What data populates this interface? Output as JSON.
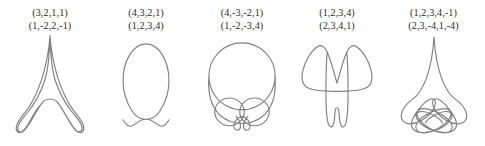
{
  "panel": {
    "background_color": "#ffffff",
    "stroke_color": "#808080",
    "text_color": "#2b2b2b",
    "figure_count": 5
  },
  "figures": [
    {
      "index": 1,
      "label_top": "(3,2,1,1)",
      "label_bottom": "(1,-2,2,-1)",
      "shape_name": "spire-with-two-base-loops",
      "left": 2,
      "width": 96
    },
    {
      "index": 2,
      "label_top": "(4,3,2,1)",
      "label_bottom": "(1,2,3,4)",
      "shape_name": "round-scalloped-bottom-curve",
      "left": 98,
      "width": 96
    },
    {
      "index": 3,
      "label_top": "(4,-3,-2,1)",
      "label_bottom": "(1,-2,-3,4)",
      "shape_name": "skull-two-eyes-and-nose-loop",
      "left": 192,
      "width": 100
    },
    {
      "index": 4,
      "label_top": "(1,2,3,4)",
      "label_bottom": "(2,3,4,1)",
      "shape_name": "butterfly-two-wings-two-legs",
      "left": 288,
      "width": 98
    },
    {
      "index": 5,
      "label_top": "(1,2,3,4,-1)",
      "label_bottom": "(2,3,-4,1,-4)",
      "shape_name": "spire-with-three-petal-loops",
      "left": 384,
      "width": 99
    }
  ],
  "paths": {
    "figure1": "M50,2 C49.2,16 46,36 40,56 C34,74 27,88 21,96 C14.5,104.5 9,110 7.5,116.5 C6,123 9.5,127 14.5,124.5 C20,121.5 25,112 29.5,104 C33.5,97 36,93 38,90 C40,87.5 41,86 41.5,85.5 M50,2 C50.8,16 54,36 60,56 C66,74 73,88 79,96 C85.5,104.5 91,110 92.5,116.5 C94,123 90.5,127 85.5,124.5 C80,121.5 75,112 70.5,104 C66.5,97 64,93 62,90 C60,87.5 59,86 58.5,85.5 M41.5,85.5 C43.5,83.5 46.5,82.5 50,82.5 C53.5,82.5 56.5,83.5 58.5,85.5 C62,89 65.5,95 69.5,102 C74,110 79,119.5 84,123 C88,125.6 91.5,123 90.5,117.5 C89.5,112 84,106.5 78,99 C71,90.5 63,77 57,60 C52.5,47 50.5,22 50,2 M38,90 C34,94 31,99 28,104.5 C24,112 19,121 15,123.5 C11,126 8.5,123 9.5,117.5 C10.5,112 16,106.5 22,99 C29,90.5 37,77 43,60 C47.5,47 49.5,22 50,2",
    "figure2": "M50,104 C42,104 37,100.5 33,94 C27,84.5 22,72 22,57 C22,33 34,12 50,12 C66,12 78,33 78,57 C78,72 73,84.5 67,94 C63,100.5 58,104 50,104 M50,104 C44.5,104 41,106.5 38,109 C35,111.5 33,112.5 31,112.5 C28.5,112.5 26.5,111 25,109 C23.5,107 22.5,105.5 22,104.8 M50,104 C55.5,104 59,106.5 62,109 C65,111.5 67,112.5 69,112.5 C71.5,112.5 73.5,111 75,109 C76.5,107 77.5,105.5 78,104.8",
    "figure3": "M50,10 C70.5,10 87,26.5 87,47 C87,62 78.5,75 66,81 M50,10 C29.5,10 13,26.5 13,47 C13,62 21.5,75 34,81 M34,81 C39,83.5 44.3,84.8 50,84.8 C55.7,84.8 61,83.5 66,81 M13,47 C13,47 11.8,62 15,73 C18.5,85 26,93.5 36.5,97.5 C41,99.2 45.5,100 50,100 C54.5,100 59,99.2 63.5,97.5 C74,93.5 81.5,85 85,73 C88.2,62 87,47 87,47 M36,71.5 C45,71.5 52.5,78.5 52.5,87 C52.5,95.5 45,102.5 36,102.5 C27,102.5 19.5,95.5 19.5,87 C19.5,78.5 27,71.5 36,71.5 M64,71.5 C73,71.5 80.5,78.5 80.5,87 C80.5,95.5 73,102.5 64,102.5 C55,102.5 47.5,95.5 47.5,87 C47.5,78.5 55,71.5 64,71.5 M43.5,92 C46,95 48,98.5 48.3,102 C48.6,105.6 46.5,108 44,107.3 C41.5,106.6 40.5,103.5 41.3,100.3 C42,97.3 44.5,94.8 47,93.3 C48.2,92.6 49.3,92.3 50,92.3 C50.7,92.3 51.8,92.6 53,93.3 C55.5,94.8 58,97.3 58.7,100.3 C59.5,103.5 58.5,106.6 56,107.3 C53.5,108 51.4,105.6 51.7,102 C52,98.5 54,95 56.5,92",
    "figure4": "M50,60 C46,46 42.5,32 38,22 C34.5,14.5 30.5,12.5 26,15.5 C18.5,20.5 11.5,32 8.5,44 C6,54 8,62.5 15,66 C23,70 36,70 50,70 M50,60 C54,46 57.5,32 62,22 C65.5,14.5 69.5,12.5 74,15.5 C81.5,20.5 88.5,32 91.5,44 C94,54 92,62.5 85,66 C77,70 64,70 50,70 M38,22 C37,34 36.5,52 36.5,70 C36.5,86 37,98.5 38.5,106 C39.5,111.5 41.5,114 43.5,113 C45.5,112 46.5,108 47,103 C47.3,99.5 47.5,96 47.8,93 M62,22 C63,34 63.5,52 63.5,70 C63.5,86 63,98.5 61.5,106 C60.5,111.5 58.5,114 56.5,113 C54.5,112 53.5,108 53,103 C52.7,99.5 52.5,96 52.2,93 M47.8,93 C48.2,91 49,90 50,90 C51,90 51.8,91 52.2,93",
    "figure5": "M50,4 C49,20 46,42 40,58 C35,71 29,80 23,84.5 M50,4 C51,20 54,42 60,58 C65,71 71,80 77,84.5 M23,84.5 C16,89.5 10,96 8,102.5 C5.5,110.5 9.5,117 18,117.5 C28,118 40,111 47,101.5 C51,96 52.5,91 51.5,87.5 C50.8,85 48.5,84 45.5,85 C41,86.5 35,92 30,98.5 C24.5,105.5 20,113 20.5,119 C21,125.5 27.5,129.5 37,129 C49,128.3 62,121.5 68.5,113 C72.5,107.8 73,103 70.5,100 C68.2,97.3 63,97 57,98.5 C48,100.8 37.5,106 31.5,112 C26.5,117 25,122 27.5,125.5 C30.5,129.5 38.5,130 47.5,127.5 C58,124.6 68,118 72,111.5 C74.8,107 74,103 69.5,101.8 C65,100.6 57.5,102.5 51,106 C45,109.2 40.5,113 39,116.5 M77,84.5 C84,89.5 90,96 92,102.5 C94.5,110.5 90.5,117 82,117.5 C72,118 60,111 53,101.5 C49,96 47.5,91 48.5,87.5 C49.2,85 51.5,84 54.5,85 C59,86.5 65,92 70,98.5 C75.5,105.5 80,113 79.5,119 C79,125.5 72.5,129.5 63,129 C51,128.3 38,121.5 31.5,113 C27.5,107.8 27,103 29.5,100 C31.8,97.3 37,97 43,98.5 C52,100.8 62.5,106 68.5,112 C73.5,117 75,122 72.5,125.5 C69.5,129.5 61.5,130 52.5,127.5 C42,124.6 32,118 28,111.5 C25.2,107 26,103 30.5,101.8 C35,100.6 42.5,102.5 49,106 C55,109.2 59.5,113 61,116.5"
  }
}
